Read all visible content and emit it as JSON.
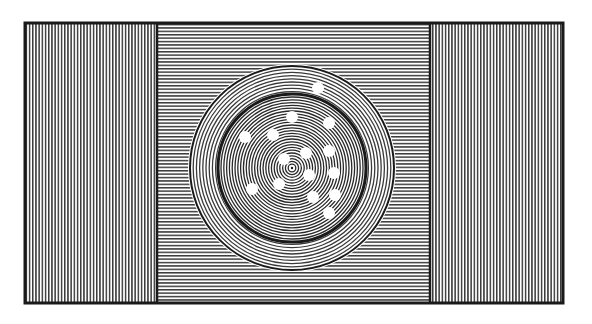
{
  "figure": {
    "colors": {
      "background": "#ffffff",
      "ink": "#1a1a1a",
      "hatch": "#3a3a3a"
    },
    "frame": {
      "x": 25,
      "y": 23,
      "width": 538,
      "height": 280,
      "stroke": 3
    },
    "panels": [
      {
        "name": "left-panel",
        "x": 25,
        "width": 132,
        "hatch": "vertical"
      },
      {
        "name": "center-panel",
        "x": 157,
        "width": 273,
        "hatch": "horizontal"
      },
      {
        "name": "right-panel",
        "x": 430,
        "width": 133,
        "hatch": "vertical"
      }
    ],
    "dish": {
      "cx": 292,
      "cy": 168,
      "outer_radius": 102,
      "inner_radius": 74,
      "center_radius": 6
    },
    "dots": [
      {
        "x": 318,
        "y": 88
      },
      {
        "x": 292,
        "y": 117
      },
      {
        "x": 329,
        "y": 123
      },
      {
        "x": 245,
        "y": 137
      },
      {
        "x": 273,
        "y": 135
      },
      {
        "x": 306,
        "y": 153
      },
      {
        "x": 329,
        "y": 151
      },
      {
        "x": 284,
        "y": 159
      },
      {
        "x": 334,
        "y": 173
      },
      {
        "x": 309,
        "y": 175
      },
      {
        "x": 252,
        "y": 189
      },
      {
        "x": 279,
        "y": 184
      },
      {
        "x": 313,
        "y": 197
      },
      {
        "x": 335,
        "y": 195
      },
      {
        "x": 329,
        "y": 213
      }
    ],
    "dot_radius": 6
  }
}
